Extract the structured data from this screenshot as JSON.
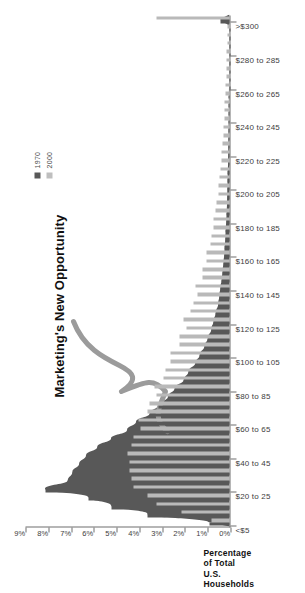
{
  "chart_data": {
    "type": "bar",
    "title": "",
    "annotation": "Marketing's New Opportunity",
    "xlabel": "",
    "ylabel": "Percentage of Total U.S. Households",
    "ylim": [
      0,
      9
    ],
    "ytick_labels": [
      "0%",
      "1%",
      "2%",
      "3%",
      "4%",
      "5%",
      "6%",
      "7%",
      "8%",
      "9%"
    ],
    "ytick_values": [
      0,
      1,
      2,
      3,
      4,
      5,
      6,
      7,
      8,
      9
    ],
    "grid": false,
    "legend_position": "top-right",
    "categories": [
      "<$5",
      "$5 to 10",
      "$10 to 15",
      "$15 to 20",
      "$20 to 25",
      "$25 to 30",
      "$30 to 35",
      "$35 to 40",
      "$40 to 45",
      "$45 to 50",
      "$50 to 55",
      "$55 to 60",
      "$60 to 65",
      "$65 to 70",
      "$70 to 75",
      "$75 to 80",
      "$80 to 85",
      "$85 to 90",
      "$90 to 95",
      "$95 to 100",
      "$100 to 105",
      "$105 to 110",
      "$110 to 115",
      "$115 to 120",
      "$120 to 125",
      "$125 to 130",
      "$130 to 135",
      "$135 to 140",
      "$140 to 145",
      "$145 to 150",
      "$150 to 155",
      "$155 to 160",
      "$160 to 165",
      "$165 to 170",
      "$170 to 175",
      "$175 to 180",
      "$180 to 185",
      "$185 to 190",
      "$190 to 195",
      "$195 to 200",
      "$200 to 205",
      "$205 to 210",
      "$210 to 215",
      "$215 to 220",
      "$220 to 225",
      "$225 to 230",
      "$230 to 235",
      "$235 to 240",
      "$240 to 245",
      "$245 to 250",
      "$250 to 255",
      "$255 to 260",
      "$260 to 265",
      "$265 to 270",
      "$270 to 275",
      "$275 to 280",
      "$280 to 285",
      "$285 to 290",
      "$290 to 295",
      "$295 to 300",
      ">$300"
    ],
    "visible_tick_labels": [
      "<$5",
      "$20 to 25",
      "$40 to 45",
      "$60 to 65",
      "$80 to 85",
      "$100 to 105",
      "$120 to 125",
      "$140 to 145",
      "$160 to 165",
      "$180 to 185",
      "$200 to 205",
      "$220 to 225",
      "$240 to 245",
      "$260 to 265",
      "$280 to 285",
      ">$300"
    ],
    "series": [
      {
        "name": "1970",
        "color": "#585858",
        "values": [
          0.9,
          3.6,
          5.2,
          6.2,
          8.1,
          7.1,
          6.9,
          6.6,
          6.3,
          5.8,
          5.2,
          4.5,
          4.1,
          3.5,
          3.1,
          2.7,
          2.4,
          2.0,
          1.8,
          1.5,
          1.3,
          1.1,
          0.95,
          0.8,
          0.7,
          0.6,
          0.5,
          0.45,
          0.4,
          0.34,
          0.3,
          0.26,
          0.23,
          0.2,
          0.18,
          0.16,
          0.14,
          0.12,
          0.11,
          0.1,
          0.09,
          0.08,
          0.07,
          0.06,
          0.055,
          0.05,
          0.045,
          0.04,
          0.035,
          0.03,
          0.028,
          0.025,
          0.022,
          0.02,
          0.018,
          0.016,
          0.014,
          0.012,
          0.01,
          0.009,
          0.4
        ]
      },
      {
        "name": "2000",
        "color": "#b9b9b9",
        "values": [
          0.8,
          2.1,
          3.2,
          3.6,
          4.2,
          4.3,
          4.4,
          4.4,
          4.5,
          4.3,
          4.2,
          3.9,
          4.0,
          3.6,
          3.5,
          3.2,
          3.3,
          2.9,
          2.8,
          2.6,
          2.6,
          2.2,
          2.2,
          1.9,
          2.0,
          1.7,
          1.6,
          1.4,
          1.5,
          1.2,
          1.2,
          1.0,
          1.0,
          0.85,
          0.8,
          0.7,
          0.7,
          0.6,
          0.55,
          0.5,
          0.48,
          0.42,
          0.4,
          0.35,
          0.33,
          0.3,
          0.28,
          0.25,
          0.24,
          0.21,
          0.2,
          0.18,
          0.17,
          0.15,
          0.14,
          0.13,
          0.12,
          0.11,
          0.1,
          0.09,
          3.2
        ]
      }
    ]
  },
  "legend": {
    "items": [
      {
        "label": "1970",
        "color": "#585858"
      },
      {
        "label": "2000",
        "color": "#bfbfbf"
      }
    ]
  },
  "axis_title": {
    "line1": "Percentage",
    "line2": "of Total",
    "line3": "U.S.",
    "line4": "Households"
  },
  "annotation": {
    "text": "Marketing's New Opportunity"
  }
}
